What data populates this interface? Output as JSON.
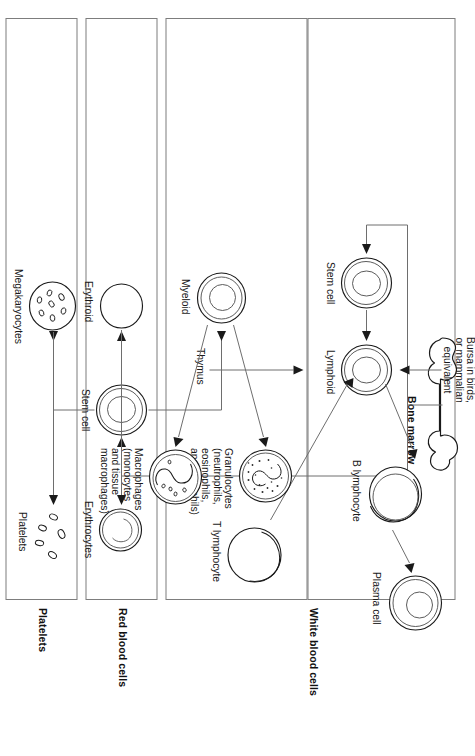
{
  "figure": {
    "orientation": "rotated-90-clockwise"
  },
  "source_label": {
    "name": "Bone marrow",
    "text": "Bone marrow"
  },
  "sections": [
    {
      "id": "white-blood-cells",
      "label": "White blood cells"
    },
    {
      "id": "red-blood-cells",
      "label": "Red blood cells"
    },
    {
      "id": "platelets",
      "label": "Platelets"
    }
  ],
  "stem_cells": [
    {
      "id": "stem-cell-lymphoid-branch",
      "label": "Stem cell"
    },
    {
      "id": "stem-cell-myeloid-branch",
      "label": "Stem cell"
    }
  ],
  "progenitors": [
    {
      "id": "lymphoid",
      "label": "Lymphoid"
    },
    {
      "id": "myeloid",
      "label": "Myeloid"
    },
    {
      "id": "erythroid",
      "label": "Erythroid"
    }
  ],
  "pathway_labels": [
    {
      "id": "bursa",
      "label": "Bursa in birds,\nor mammalian\nequivalent",
      "lines": [
        "Bursa in birds,",
        "or mammalian",
        "equivalent"
      ]
    },
    {
      "id": "thymus",
      "label": "Thymus",
      "lines": [
        "Thymus"
      ]
    }
  ],
  "cells": [
    {
      "id": "b-lymphocyte",
      "label": "B lymphocyte",
      "lines": [
        "B lymphocyte"
      ]
    },
    {
      "id": "plasma-cell",
      "label": "Plasma cell",
      "lines": [
        "Plasma cell"
      ]
    },
    {
      "id": "t-lymphocyte",
      "label": "T lymphocyte",
      "lines": [
        "T lymphocyte"
      ]
    },
    {
      "id": "granulocytes",
      "label": "Granulocytes (neutrophils, eosinophils, and basophils)",
      "lines": [
        "Granulocytes",
        "(neutrophils,",
        "eosinophils,",
        "and basophils)"
      ]
    },
    {
      "id": "macrophages",
      "label": "Macrophages (monocytes and tissue macrophages)",
      "lines": [
        "Macrophages",
        "(monocytes",
        "and tissue",
        "macrophages)"
      ]
    },
    {
      "id": "erythrocytes",
      "label": "Erythrocytes",
      "lines": [
        "Erythrocytes"
      ]
    },
    {
      "id": "megakaryocytes",
      "label": "Megakaryocytes",
      "lines": [
        "Megakaryocytes"
      ]
    },
    {
      "id": "platelets-cell",
      "label": "Platelets",
      "lines": [
        "Platelets"
      ]
    }
  ],
  "colors": {
    "background": "#ffffff",
    "line": "#6e6e6e",
    "cell_outline": "#1a1a1a",
    "text": "#1a1a1a",
    "box_border": "#7d7d7d"
  }
}
